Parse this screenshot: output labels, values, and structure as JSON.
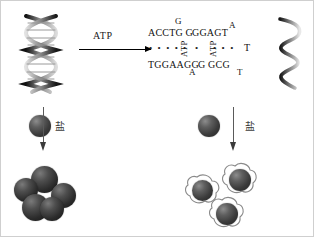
{
  "figure": {
    "type": "scientific-schematic"
  },
  "reactions": {
    "top_arrow_label": "ATP",
    "left_salt_label": "盐",
    "right_salt_label": "盐"
  },
  "sequence": {
    "top_strand": "ACCTG G",
    "top_strand_2": "GGAGT",
    "top_sup_g": "G",
    "top_sup_a": "A",
    "bottom_strand": "TGGAAGG",
    "bottom_strand_2": "G GCG",
    "bottom_sub_a": "A",
    "bottom_sub_t": "T",
    "right_t": "T",
    "vertical_label_left": "ATP",
    "vertical_label_right": "ATP",
    "dots_left": "• • • •",
    "dots_mid": "•",
    "dots_right": "• • •"
  },
  "elements": {
    "left_helix": "dna-double-helix",
    "right_helix": "dna-single-strand",
    "left_particle": "gold-nanoparticle",
    "right_particle": "gold-nanoparticle",
    "aggregate_label": "aggregated-nanoparticles",
    "dispersed_label": "dispersed-coated-nanoparticles"
  },
  "colors": {
    "particle_dark": "#3b3b3b",
    "particle_light": "#8d8d8d",
    "arrow": "#000000",
    "text": "#111111"
  }
}
